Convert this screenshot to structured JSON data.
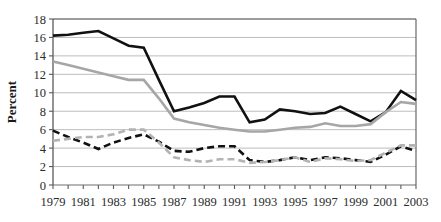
{
  "chart_data": {
    "type": "line",
    "title": "",
    "xlabel": "",
    "ylabel": "Percent",
    "xlim": [
      1979,
      2003
    ],
    "ylim": [
      0,
      18
    ],
    "ytick_step": 2,
    "xtick_label_step": 2,
    "grid": "horizontal",
    "legend": "none",
    "x": [
      1979,
      1980,
      1981,
      1982,
      1983,
      1984,
      1985,
      1986,
      1987,
      1988,
      1989,
      1990,
      1991,
      1992,
      1993,
      1994,
      1995,
      1996,
      1997,
      1998,
      1999,
      2000,
      2001,
      2002,
      2003
    ],
    "xtick_labels": [
      "1979",
      "1981",
      "1983",
      "1985",
      "1987",
      "1989",
      "1991",
      "1993",
      "1995",
      "1997",
      "1999",
      "2001",
      "2003"
    ],
    "ytick_labels": [
      "0",
      "2",
      "4",
      "6",
      "8",
      "10",
      "12",
      "14",
      "16",
      "18"
    ],
    "series": [
      {
        "name": "black-solid-series",
        "color": "#111111",
        "style": "solid",
        "width": 2.6,
        "values": [
          16.2,
          16.3,
          16.5,
          16.7,
          15.9,
          15.1,
          14.9,
          11.4,
          8.0,
          8.4,
          8.9,
          9.6,
          9.6,
          6.8,
          7.1,
          8.2,
          8.0,
          7.7,
          7.8,
          8.5,
          7.7,
          6.9,
          7.9,
          10.2,
          9.2
        ]
      },
      {
        "name": "gray-solid-series",
        "color": "#a6a6a6",
        "style": "solid",
        "width": 2.6,
        "values": [
          13.4,
          13.0,
          12.6,
          12.2,
          11.8,
          11.4,
          11.4,
          9.4,
          7.2,
          6.8,
          6.5,
          6.2,
          6.0,
          5.8,
          5.8,
          6.0,
          6.2,
          6.3,
          6.7,
          6.4,
          6.4,
          6.6,
          7.9,
          9.0,
          8.8
        ]
      },
      {
        "name": "black-dashed-series",
        "color": "#111111",
        "style": "dashed",
        "width": 2.6,
        "values": [
          5.9,
          5.2,
          4.6,
          3.9,
          4.6,
          5.1,
          5.5,
          4.7,
          3.7,
          3.6,
          4.0,
          4.2,
          4.2,
          2.7,
          2.5,
          2.7,
          3.0,
          2.7,
          3.0,
          2.9,
          2.7,
          2.5,
          3.3,
          4.2,
          3.7
        ]
      },
      {
        "name": "gray-dashed-series",
        "color": "#b3b3b3",
        "style": "dashed",
        "width": 2.6,
        "values": [
          4.8,
          5.0,
          5.2,
          5.2,
          5.5,
          6.0,
          6.0,
          4.6,
          3.0,
          2.7,
          2.5,
          2.8,
          2.8,
          2.4,
          2.5,
          2.7,
          3.0,
          2.5,
          2.9,
          2.8,
          2.6,
          2.7,
          3.5,
          4.3,
          4.3
        ]
      }
    ]
  },
  "plot": {
    "x0": 53,
    "x1": 416,
    "y0": 185,
    "y1": 19,
    "axis_color": "#6e6e6e",
    "grid_color": "#bdbdbd",
    "border_color": "#5a5a5a"
  }
}
